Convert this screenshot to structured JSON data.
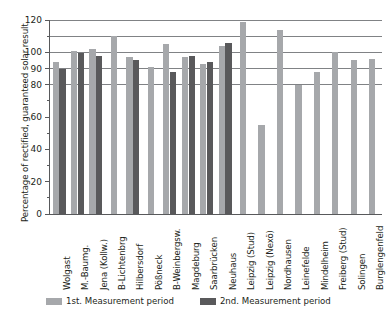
{
  "chart_data": {
    "type": "bar",
    "title": "",
    "xlabel": "",
    "ylabel": "Percentage of rectified, guaranteed solar result",
    "ylim": [
      0,
      120
    ],
    "yticks": [
      0,
      20,
      40,
      60,
      80,
      90,
      100,
      120
    ],
    "ytick_labels": [
      "0",
      "20",
      "40",
      "60",
      "80",
      "90",
      "100",
      "120"
    ],
    "minor_yticks": [
      10,
      30,
      50,
      70,
      110
    ],
    "gridlines": [
      80,
      90,
      100,
      110,
      120
    ],
    "grid": true,
    "legend_position": "bottom",
    "categories": [
      "Wolgast",
      "M.-Baumg.",
      "Jena (Kollw.)",
      "B-Lichtenbrg",
      "Hilbersdorf",
      "Pößneck",
      "B-Weinbergsw.",
      "Magdeburg",
      "Saarbrücken",
      "Neuhaus",
      "Leipzig (Stud)",
      "Leipzig (Nexö)",
      "Nordhausen",
      "Leinefelde",
      "Mindelheim",
      "Freiberg (Stud)",
      "Solingen",
      "Burglengenfeld"
    ],
    "series": [
      {
        "name": "1st. Measurement period",
        "color": "#a6a8ab",
        "values": [
          94,
          101,
          102,
          110,
          97,
          91,
          105,
          97,
          93,
          104,
          119,
          55,
          114,
          80,
          88,
          100,
          95,
          96
        ]
      },
      {
        "name": "2nd. Measurement period",
        "color": "#59595b",
        "values": [
          90,
          99.5,
          97.5,
          null,
          95.5,
          null,
          88,
          98,
          94,
          106,
          null,
          null,
          null,
          null,
          null,
          null,
          null,
          null
        ]
      }
    ]
  },
  "legend": {
    "entries": [
      {
        "label": "1st. Measurement period"
      },
      {
        "label": "2nd. Measurement period"
      }
    ]
  }
}
